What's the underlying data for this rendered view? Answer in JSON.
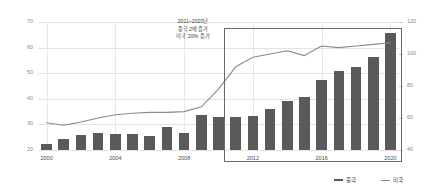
{
  "chart_data": {
    "type": "bar",
    "title": "",
    "xlabel": "",
    "ylabel": "",
    "grid": true,
    "legend_position": "bottom-right",
    "x": [
      2000,
      2001,
      2002,
      2003,
      2004,
      2005,
      2006,
      2007,
      2008,
      2009,
      2010,
      2011,
      2012,
      2013,
      2014,
      2015,
      2016,
      2017,
      2018,
      2019,
      2020
    ],
    "categories": [
      "2000",
      "2001",
      "2002",
      "2003",
      "2004",
      "2005",
      "2006",
      "2007",
      "2008",
      "2009",
      "2010",
      "2011",
      "2012",
      "2013",
      "2014",
      "2015",
      "2016",
      "2017",
      "2018",
      "2019",
      "2020"
    ],
    "xtick_labels": [
      "2000",
      "2004",
      "2008",
      "2012",
      "2016",
      "2020"
    ],
    "xtick_positions": [
      2000,
      2004,
      2008,
      2012,
      2016,
      2020
    ],
    "y_left_ticks": [
      "20",
      "30",
      "40",
      "50",
      "60",
      "70"
    ],
    "y_right_ticks": [
      "40",
      "60",
      "80",
      "100",
      "120"
    ],
    "ylim": [
      20,
      70
    ],
    "y2lim": [
      40,
      120
    ],
    "series": [
      {
        "name": "중국",
        "type": "bar",
        "axis": "left",
        "color": "#5a5a5a",
        "values": [
          22.5,
          24.4,
          25.8,
          26.5,
          26.2,
          26.1,
          25.3,
          28.8,
          26.7,
          33.6,
          33.0,
          32.9,
          33.2,
          36.0,
          39.2,
          40.6,
          47.2,
          50.8,
          52.4,
          56.2,
          65.8
        ]
      },
      {
        "name": "미국",
        "type": "line",
        "axis": "right",
        "color": "#8a8a8a",
        "values": [
          57,
          55.5,
          57.5,
          60,
          62,
          63,
          63.5,
          63.5,
          64,
          67,
          78,
          92,
          98,
          100,
          102,
          99,
          105,
          104,
          105,
          106,
          107
        ]
      }
    ],
    "annotations": [
      {
        "name": "growth-callout",
        "lines": [
          "2011~2020년",
          "중국 2배 증가",
          "미국 20% 증가"
        ]
      }
    ],
    "highlight_region": {
      "name": "highlight-box-2011-2020",
      "from": 2011,
      "to": 2020,
      "border_color": "#6a6a6a"
    },
    "colors": {
      "bar": "#5a5a5a",
      "line": "#8a8a8a",
      "grid": "#e3e3e3",
      "axis_text": "#8a8a8a",
      "tick_text": "#4a4a4a",
      "highlight_border": "#6a6a6a",
      "background": "#ffffff"
    }
  }
}
